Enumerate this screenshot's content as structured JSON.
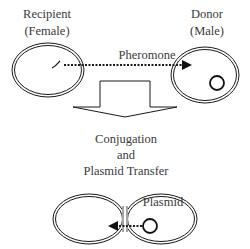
{
  "diagram": {
    "top": {
      "recipient_label_line1": "Recipient",
      "recipient_label_line2": "(Female)",
      "donor_label_line1": "Donor",
      "donor_label_line2": "(Male)",
      "signal_label": "Pheromone"
    },
    "process": {
      "line1": "Conjugation",
      "line2": "and",
      "line3": "Plasmid Transfer"
    },
    "bottom": {
      "plasmid_label": "Plasmid"
    },
    "colors": {
      "stroke": "#1a1a1a",
      "text": "#3a3a3a",
      "background": "#ffffff"
    }
  }
}
